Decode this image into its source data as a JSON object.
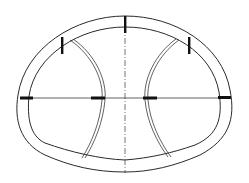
{
  "diagram": {
    "type": "tunnel-cross-section",
    "title": "",
    "labels": [],
    "colors": {
      "line": "#2a2a2a",
      "marker": "#111111",
      "background": "#ffffff"
    },
    "components": {
      "outer_lining": "horseshoe-shaped outer shell",
      "inner_lining": "inner shell parallel to outer shell",
      "centerline_vertical": "dashed vertical axis",
      "springline_horizontal": "horizontal axis line",
      "left_partition": "curved double-line temporary support (left)",
      "right_partition": "curved double-line temporary support (right)",
      "joint_markers": 7
    }
  }
}
